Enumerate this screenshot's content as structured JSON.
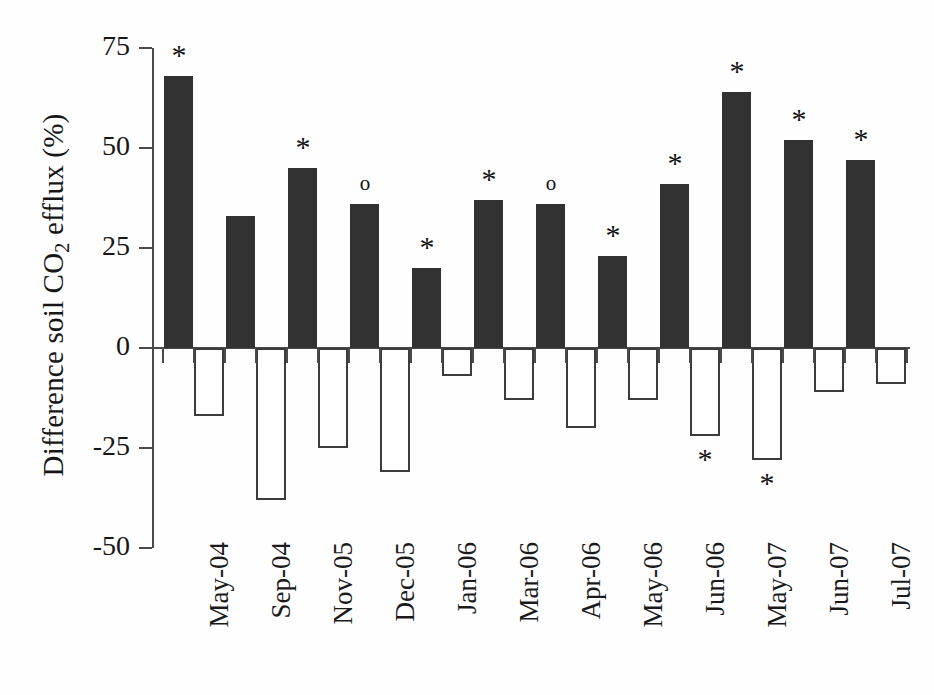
{
  "chart_data": {
    "type": "bar",
    "title": "",
    "xlabel": "",
    "ylabel": "Difference soil CO2 efflux (%)",
    "ylabel_parts": {
      "pre": "Difference soil CO",
      "sub": "2",
      "post": " efflux (%)"
    },
    "ylim": [
      -50,
      75
    ],
    "yticks": [
      75,
      50,
      25,
      0,
      -25,
      -50
    ],
    "ytick_labels": [
      "75",
      "50",
      "25",
      "0",
      "-25",
      "-50"
    ],
    "grid": false,
    "legend": "none",
    "categories": [
      "May-04",
      "Sep-04",
      "Nov-05",
      "Dec-05",
      "Jan-06",
      "Mar-06",
      "Apr-06",
      "May-06",
      "Jun-06",
      "May-07",
      "Jun-07",
      "Jul-07"
    ],
    "series": [
      {
        "name": "Positive difference",
        "style": "filled-black",
        "color": "#323232",
        "values": [
          68,
          33,
          45,
          36,
          20,
          37,
          36,
          23,
          41,
          64,
          52,
          47
        ]
      },
      {
        "name": "Negative difference",
        "style": "open-white",
        "color": "#ffffff",
        "edge_color": "#3c3c3c",
        "values": [
          -17,
          -38,
          -25,
          -31,
          -7,
          -13,
          -20,
          -13,
          -22,
          -28,
          -11,
          -9
        ]
      }
    ],
    "annotations": {
      "positive_markers": [
        "*",
        "",
        "*",
        "o",
        "*",
        "*",
        "o",
        "*",
        "*",
        "*",
        "*",
        "*"
      ],
      "negative_markers": [
        "",
        "",
        "",
        "",
        "",
        "",
        "",
        "",
        "*",
        "*",
        "",
        ""
      ],
      "marker_meanings": {
        "asterisk": "*",
        "circle": "o"
      }
    }
  }
}
